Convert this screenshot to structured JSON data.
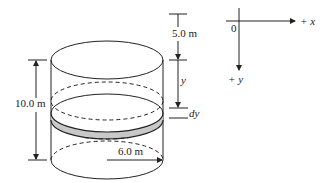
{
  "figure": {
    "labels": {
      "top_distance": "5.0 m",
      "height": "10.0 m",
      "radius": "6.0 m",
      "depth_var": "y",
      "thickness": "dy",
      "origin": "0",
      "x_axis": "+ x",
      "y_axis": "+ y"
    },
    "colors": {
      "stroke": "#222222",
      "slab_fill": "#c8c8c8",
      "background": "#ffffff"
    }
  }
}
